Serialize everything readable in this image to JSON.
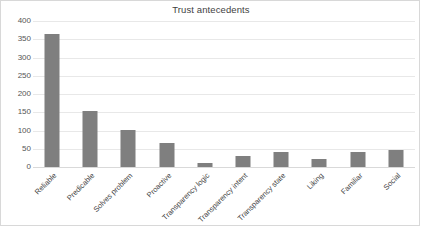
{
  "chart_data": {
    "type": "bar",
    "title": "Trust antecedents",
    "xlabel": "",
    "ylabel": "",
    "ylim": [
      0,
      400
    ],
    "ytick_step": 50,
    "yticks": [
      "400",
      "350",
      "300",
      "250",
      "200",
      "150",
      "100",
      "50",
      "0"
    ],
    "grid": true,
    "legend": "none",
    "bar_color": "#7f7f7f",
    "gridline_color": "#e8e8e8",
    "categories": [
      "Reliable",
      "Predicable",
      "Solves problem",
      "Proactive",
      "Transparency logic",
      "Transparency intent",
      "Transparency state",
      "Liking",
      "Familiar",
      "Social"
    ],
    "values": [
      365,
      153,
      101,
      65,
      10,
      30,
      42,
      22,
      40,
      46
    ]
  }
}
